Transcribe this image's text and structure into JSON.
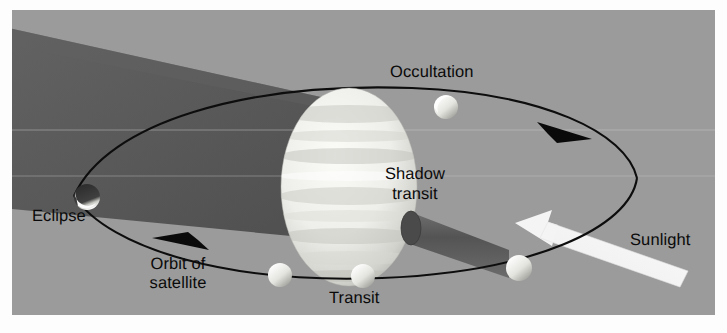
{
  "figure": {
    "name": "satellite-phenomena-diagram",
    "background_color": "#9b9b9b",
    "border_color": "#fdfdfd",
    "ink_color": "#0a0a0a",
    "shadow_color": "#5d5d5d",
    "sunbeam_color": "#f2f2f2",
    "planet_color": "#e8e8e4"
  },
  "labels": {
    "occultation": "Occultation",
    "eclipse": "Eclipse",
    "orbit_line1": "Orbit of",
    "orbit_line2": "satellite",
    "shadow_line1": "Shadow",
    "shadow_line2": "transit",
    "transit": "Transit",
    "sunlight": "Sunlight"
  },
  "elements": {
    "planet": "banded-gas-giant",
    "orbit": "elliptical-orbit-path",
    "shadow_cone": "planet-shadow-cone",
    "shadow_cylinder": "satellite-shadow-cylinder",
    "sun_arrow": "sunlight-direction-arrow",
    "orbit_arrow_upper": "orbit-direction-arrow-right",
    "orbit_arrow_lower": "orbit-direction-arrow-left"
  },
  "satellites": [
    {
      "name": "satellite-occultation",
      "cx": 434,
      "cy": 97,
      "r": 12,
      "state": "lit"
    },
    {
      "name": "satellite-eclipse",
      "cx": 75,
      "cy": 187,
      "r": 13,
      "state": "eclipsed"
    },
    {
      "name": "satellite-orbit-left",
      "cx": 268,
      "cy": 265,
      "r": 12,
      "state": "lit"
    },
    {
      "name": "satellite-transit",
      "cx": 351,
      "cy": 266,
      "r": 12,
      "state": "lit"
    },
    {
      "name": "satellite-shadow-caster",
      "cx": 507,
      "cy": 258,
      "r": 13,
      "state": "lit"
    }
  ]
}
